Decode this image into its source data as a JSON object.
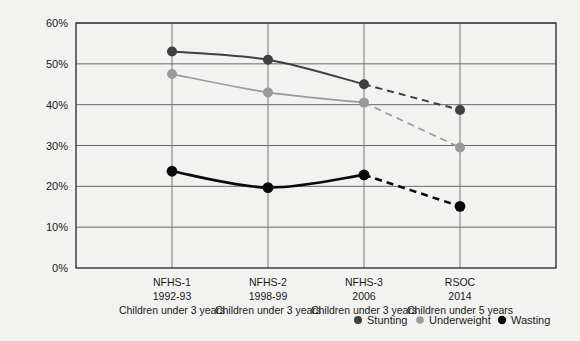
{
  "chart_data": {
    "type": "line",
    "title": "",
    "subtitle": "",
    "xlabel": "",
    "ylabel": "",
    "ylim": [
      0,
      60
    ],
    "grid": true,
    "legend_position": "bottom-right",
    "categories": [
      "NFHS-1",
      "NFHS-2",
      "NFHS-3",
      "RSOC"
    ],
    "category_lines": [
      [
        "NFHS-1",
        "1992-93",
        "Children under 3 years"
      ],
      [
        "NFHS-2",
        "1998-99",
        "Children under 3 years"
      ],
      [
        "NFHS-3",
        "2006",
        "Children under 3 years"
      ],
      [
        "RSOC",
        "2014",
        "Children under 5 years"
      ]
    ],
    "ytick_labels": [
      "0%",
      "10%",
      "20%",
      "30%",
      "40%",
      "50%",
      "60%"
    ],
    "ytick_values": [
      0,
      10,
      20,
      30,
      40,
      50,
      60
    ],
    "series": [
      {
        "name": "Stunting",
        "color": "#3f3f3f",
        "values": [
          53,
          51,
          45,
          38.7
        ],
        "dashed_from_index": 2
      },
      {
        "name": "Underweight",
        "color": "#9a9a9a",
        "values": [
          47.5,
          43,
          40.5,
          29.5
        ],
        "dashed_from_index": 2
      },
      {
        "name": "Wasting",
        "color": "#0a0a0a",
        "values": [
          23.7,
          19.7,
          22.8,
          15.1
        ],
        "dashed_from_index": 2
      }
    ]
  },
  "legend": {
    "items": [
      {
        "label": "Stunting",
        "color": "#3f3f3f"
      },
      {
        "label": "Underweight",
        "color": "#9a9a9a"
      },
      {
        "label": "Wasting",
        "color": "#0a0a0a"
      }
    ]
  },
  "colors": {
    "background": "#f2f2f0",
    "frame": "#333333",
    "grid": "#595959",
    "stunting": "#3f3f3f",
    "underweight": "#9a9a9a",
    "wasting": "#0a0a0a"
  }
}
